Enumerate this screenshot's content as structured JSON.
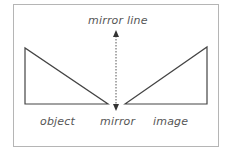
{
  "diagram": {
    "labels": {
      "mirror_line": "mirror line",
      "object": "object",
      "mirror": "mirror",
      "image": "image"
    },
    "colors": {
      "frame": "#b5b5b5",
      "shape_stroke": "#444444",
      "text": "#555555"
    }
  }
}
